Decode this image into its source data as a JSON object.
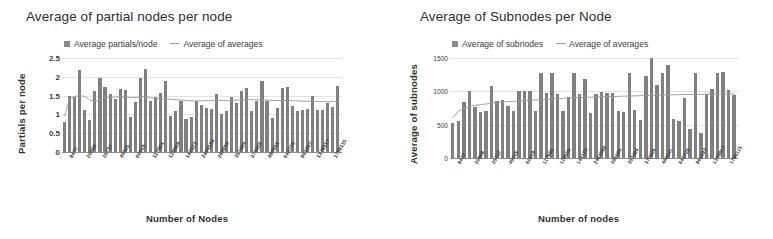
{
  "charts": [
    {
      "id": "partial-nodes",
      "title": "Average of partial nodes per node",
      "legend": [
        {
          "name": "bar-series",
          "label": "Average partials/node",
          "marker": "square-swatch"
        },
        {
          "name": "line-series",
          "label": "Average of averages",
          "marker": "line-swatch"
        }
      ],
      "ylabel": "Partials per node",
      "xlabel": "Number of Nodes",
      "yticks": [
        "2.5",
        "2",
        "1.5",
        "1",
        "0.5",
        "0"
      ],
      "colors": {
        "bar": "#808080",
        "line": "#9a9a9a",
        "grid": "#e2e2e2",
        "axis": "#8d8d8d"
      }
    },
    {
      "id": "subnodes",
      "title": "Average of Subnodes per Node",
      "legend": [
        {
          "name": "bar-series",
          "label": "Average of subnodes",
          "marker": "square-swatch"
        },
        {
          "name": "line-series",
          "label": "Average of averages",
          "marker": "line-swatch"
        }
      ],
      "ylabel": "Average of subnodes",
      "xlabel": "Number of nodes",
      "yticks": [
        "1500",
        "1000",
        "500",
        "0"
      ],
      "colors": {
        "bar": "#808080",
        "line": "#9a9a9a",
        "grid": "#e2e2e2",
        "axis": "#8d8d8d"
      }
    }
  ],
  "chart_data": [
    {
      "type": "bar",
      "title": "Average of partial nodes per node",
      "xlabel": "Number of Nodes",
      "ylabel": "Partials per node",
      "ylim": [
        0,
        2.5
      ],
      "grid": true,
      "legend_position": "top",
      "tick_labels": [
        "8477",
        "20868",
        "25737",
        "49025",
        "60619",
        "117984",
        "129559",
        "142123",
        "2464584",
        "286690",
        "357484",
        "370926",
        "480041",
        "643728",
        "861097",
        "1378917",
        "1798115"
      ],
      "categories": [
        "8477",
        "9260",
        "12058",
        "20868",
        "21440",
        "23190",
        "25737",
        "28840",
        "31005",
        "35600",
        "42811",
        "49025",
        "52300",
        "56120",
        "60619",
        "71400",
        "82300",
        "95100",
        "117984",
        "122300",
        "129559",
        "133800",
        "142123",
        "158000",
        "176500",
        "2464584",
        "210000",
        "228000",
        "286690",
        "302000",
        "318500",
        "335000",
        "357484",
        "362000",
        "370926",
        "389000",
        "402000",
        "440000",
        "480041",
        "520000",
        "560000",
        "600000",
        "643728",
        "700000",
        "760000",
        "820000",
        "861097",
        "930000",
        "1010000",
        "1120000",
        "1250000",
        "1378917",
        "1520000",
        "1680000",
        "1798115"
      ],
      "series": [
        {
          "name": "Average partials/node",
          "values": [
            0.8,
            1.5,
            1.45,
            2.18,
            1.12,
            0.86,
            1.62,
            1.97,
            1.72,
            1.54,
            1.4,
            1.68,
            1.66,
            0.92,
            1.33,
            1.96,
            2.22,
            1.35,
            1.45,
            1.57,
            1.88,
            0.97,
            1.09,
            1.37,
            0.88,
            0.92,
            1.35,
            1.25,
            1.17,
            1.14,
            1.54,
            1.0,
            1.1,
            1.47,
            1.3,
            1.63,
            1.71,
            1.1,
            1.35,
            1.9,
            1.35,
            0.9,
            1.18,
            1.7,
            1.73,
            1.22,
            1.1,
            1.12,
            1.14,
            1.48,
            1.13,
            1.12,
            1.3,
            1.2,
            1.75
          ],
          "style": "bar"
        },
        {
          "name": "Average of averages",
          "values": [
            0.95,
            1.42,
            1.48,
            1.5,
            1.48,
            1.38,
            1.35,
            1.38,
            1.44,
            1.45,
            1.46,
            1.47,
            1.47,
            1.45,
            1.45,
            1.46,
            1.47,
            1.44,
            1.42,
            1.41,
            1.41,
            1.4,
            1.39,
            1.38,
            1.37,
            1.36,
            1.36,
            1.36,
            1.37,
            1.37,
            1.37,
            1.37,
            1.37,
            1.38,
            1.38,
            1.39,
            1.39,
            1.39,
            1.39,
            1.39,
            1.38,
            1.37,
            1.37,
            1.37,
            1.37,
            1.36,
            1.36,
            1.35,
            1.35,
            1.35,
            1.34,
            1.34,
            1.34,
            1.34,
            1.34
          ],
          "style": "line"
        }
      ]
    },
    {
      "type": "bar",
      "title": "Average of Subnodes per Node",
      "xlabel": "Number of nodes",
      "ylabel": "Average of subnodes",
      "ylim": [
        0,
        1500
      ],
      "grid": true,
      "legend_position": "top",
      "tick_labels": [
        "8477",
        "20868",
        "25737",
        "49025",
        "60619",
        "117984",
        "129559",
        "142123",
        "2464584",
        "286690",
        "357484",
        "370926",
        "480041",
        "643728",
        "861097",
        "1378917",
        "1798115"
      ],
      "categories": [
        "8477",
        "9260",
        "12058",
        "20868",
        "21440",
        "23190",
        "25737",
        "28840",
        "31005",
        "35600",
        "42811",
        "49025",
        "52300",
        "56120",
        "60619",
        "71400",
        "82300",
        "95100",
        "117984",
        "122300",
        "129559",
        "133800",
        "142123",
        "158000",
        "176500",
        "2464584",
        "210000",
        "228000",
        "286690",
        "302000",
        "318500",
        "335000",
        "357484",
        "362000",
        "370926",
        "389000",
        "402000",
        "440000",
        "480041",
        "520000",
        "560000",
        "600000",
        "643728",
        "700000",
        "760000",
        "820000",
        "861097",
        "930000",
        "1010000",
        "1120000",
        "1250000",
        "1378917",
        "1520000",
        "1680000",
        "1798115"
      ],
      "series": [
        {
          "name": "Average of subnodes",
          "values": [
            520,
            560,
            840,
            1000,
            760,
            690,
            700,
            1080,
            860,
            870,
            780,
            700,
            1000,
            1010,
            1010,
            700,
            1270,
            980,
            1270,
            960,
            700,
            920,
            1280,
            960,
            1190,
            680,
            960,
            990,
            970,
            980,
            700,
            690,
            1280,
            720,
            570,
            1230,
            1500,
            1090,
            1270,
            1390,
            580,
            560,
            900,
            440,
            1280,
            380,
            960,
            1030,
            1280,
            1290,
            1020,
            950
          ],
          "style": "bar"
        },
        {
          "name": "Average of averages",
          "values": [
            600,
            700,
            740,
            770,
            790,
            800,
            810,
            820,
            830,
            840,
            845,
            850,
            855,
            860,
            865,
            870,
            875,
            880,
            885,
            890,
            895,
            900,
            905,
            908,
            910,
            912,
            915,
            918,
            920,
            922,
            925,
            928,
            930,
            932,
            935,
            938,
            940,
            942,
            944,
            946,
            948,
            950,
            952,
            953,
            954,
            955,
            956,
            957,
            958,
            959,
            960,
            960
          ],
          "style": "line"
        }
      ]
    }
  ]
}
